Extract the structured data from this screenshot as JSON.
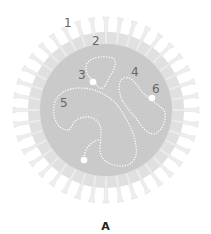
{
  "figure": {
    "caption": "A",
    "labels": [
      {
        "id": "1",
        "text": "1",
        "x": 64,
        "y": 17
      },
      {
        "id": "2",
        "text": "2",
        "x": 92,
        "y": 35
      },
      {
        "id": "3",
        "text": "3",
        "x": 78,
        "y": 69
      },
      {
        "id": "4",
        "text": "4",
        "x": 131,
        "y": 66
      },
      {
        "id": "5",
        "text": "5",
        "x": 60,
        "y": 97
      },
      {
        "id": "6",
        "text": "6",
        "x": 152,
        "y": 83
      }
    ],
    "colors": {
      "core": "#c4c4c4",
      "ring": "#dcdcdc",
      "spikes": "#ececec",
      "strand": "#ffffff",
      "label": "#666666",
      "caption": "#222222"
    }
  }
}
